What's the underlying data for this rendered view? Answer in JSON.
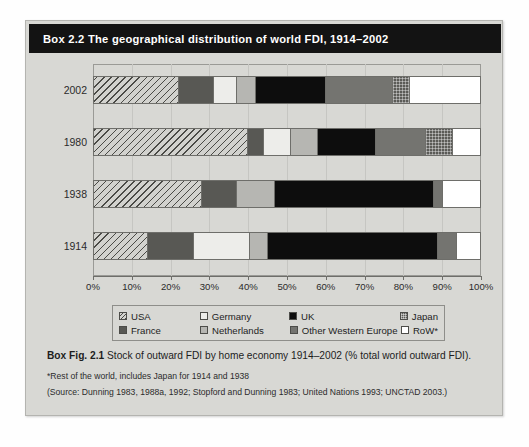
{
  "box": {
    "header_title": "Box 2.2  The geographical distribution of world FDI, 1914–2002"
  },
  "caption": {
    "label": "Box Fig. 2.1",
    "text": " Stock of outward FDI by home economy 1914–2002 (% total world outward FDI).",
    "footnote": "*Rest of the world, includes Japan for 1914 and 1938",
    "source": "(Source: Dunning 1983, 1988a, 1992; Stopford and Dunning 1983; United Nations 1993; UNCTAD 2003.)"
  },
  "legend": {
    "items": [
      {
        "label": "USA",
        "pattern": "hatch",
        "color": "#d2d2ce"
      },
      {
        "label": "Germany",
        "pattern": "solid",
        "color": "#ededea"
      },
      {
        "label": "UK",
        "pattern": "solid",
        "color": "#0d0d0d"
      },
      {
        "label": "Japan",
        "pattern": "dotted",
        "color": "#5b5b57"
      },
      {
        "label": "France",
        "pattern": "solid",
        "color": "#585854"
      },
      {
        "label": "Netherlands",
        "pattern": "solid",
        "color": "#b6b6b2"
      },
      {
        "label": "Other Western Europe",
        "pattern": "solid",
        "color": "#747470"
      },
      {
        "label": "RoW*",
        "pattern": "solid",
        "color": "#ffffff"
      }
    ]
  },
  "chart_data": {
    "type": "bar",
    "orientation": "horizontal",
    "stacked": true,
    "title": "Stock of outward FDI by home economy 1914–2002 (% total world outward FDI)",
    "xlabel": "",
    "ylabel": "",
    "xlim": [
      0,
      100
    ],
    "xticks": [
      "0%",
      "10%",
      "20%",
      "30%",
      "40%",
      "50%",
      "60%",
      "70%",
      "80%",
      "90%",
      "100%"
    ],
    "xtick_values": [
      0,
      10,
      20,
      30,
      40,
      50,
      60,
      70,
      80,
      90,
      100
    ],
    "grid": true,
    "legend_position": "below",
    "categories": [
      "2002",
      "1980",
      "1938",
      "1914"
    ],
    "series": [
      {
        "name": "USA",
        "key": "usa",
        "values": [
          22.0,
          40.0,
          28.0,
          14.0
        ]
      },
      {
        "name": "France",
        "key": "france",
        "values": [
          9.0,
          4.0,
          9.0,
          12.0
        ]
      },
      {
        "name": "Germany",
        "key": "germany",
        "values": [
          6.0,
          7.0,
          0.0,
          14.5
        ]
      },
      {
        "name": "Netherlands",
        "key": "netherlands",
        "values": [
          5.0,
          7.0,
          10.0,
          4.5
        ]
      },
      {
        "name": "UK",
        "key": "uk",
        "values": [
          18.0,
          15.0,
          41.0,
          44.0
        ]
      },
      {
        "name": "Other Western Europe",
        "key": "owe",
        "values": [
          17.5,
          13.0,
          2.5,
          5.0
        ]
      },
      {
        "name": "Japan",
        "key": "japan",
        "values": [
          4.5,
          7.0,
          0.0,
          0.0
        ]
      },
      {
        "name": "RoW*",
        "key": "row",
        "values": [
          18.0,
          7.0,
          9.5,
          6.0
        ]
      }
    ],
    "bars": [
      {
        "category": "2002",
        "segments": [
          {
            "key": "usa",
            "label": "USA",
            "value": 22.0
          },
          {
            "key": "france",
            "label": "France",
            "value": 9.0
          },
          {
            "key": "germany",
            "label": "Germany",
            "value": 6.0
          },
          {
            "key": "netherlands",
            "label": "Netherlands",
            "value": 5.0
          },
          {
            "key": "uk",
            "label": "UK",
            "value": 18.0
          },
          {
            "key": "owe",
            "label": "Other Western Europe",
            "value": 17.5
          },
          {
            "key": "japan",
            "label": "Japan",
            "value": 4.5
          },
          {
            "key": "row",
            "label": "RoW*",
            "value": 18.0
          }
        ]
      },
      {
        "category": "1980",
        "segments": [
          {
            "key": "usa",
            "label": "USA",
            "value": 40.0
          },
          {
            "key": "france",
            "label": "France",
            "value": 4.0
          },
          {
            "key": "germany",
            "label": "Germany",
            "value": 7.0
          },
          {
            "key": "netherlands",
            "label": "Netherlands",
            "value": 7.0
          },
          {
            "key": "uk",
            "label": "UK",
            "value": 15.0
          },
          {
            "key": "owe",
            "label": "Other Western Europe",
            "value": 13.0
          },
          {
            "key": "japan",
            "label": "Japan",
            "value": 7.0
          },
          {
            "key": "row",
            "label": "RoW*",
            "value": 7.0
          }
        ]
      },
      {
        "category": "1938",
        "segments": [
          {
            "key": "usa",
            "label": "USA",
            "value": 28.0
          },
          {
            "key": "france",
            "label": "France",
            "value": 9.0
          },
          {
            "key": "netherlands",
            "label": "Netherlands",
            "value": 10.0
          },
          {
            "key": "uk",
            "label": "UK",
            "value": 41.0
          },
          {
            "key": "owe",
            "label": "Other Western Europe",
            "value": 2.5
          },
          {
            "key": "row",
            "label": "RoW*",
            "value": 9.5
          }
        ]
      },
      {
        "category": "1914",
        "segments": [
          {
            "key": "usa",
            "label": "USA",
            "value": 14.0
          },
          {
            "key": "france",
            "label": "France",
            "value": 12.0
          },
          {
            "key": "germany",
            "label": "Germany",
            "value": 14.5
          },
          {
            "key": "netherlands",
            "label": "Netherlands",
            "value": 4.5
          },
          {
            "key": "uk",
            "label": "UK",
            "value": 44.0
          },
          {
            "key": "owe",
            "label": "Other Western Europe",
            "value": 5.0
          },
          {
            "key": "row",
            "label": "RoW*",
            "value": 6.0
          }
        ]
      }
    ]
  }
}
